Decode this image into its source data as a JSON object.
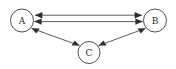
{
  "diagram": {
    "type": "directed-graph",
    "background_color": "#ffffff",
    "node_stroke_color": "#3a3a3a",
    "edge_color": "#4a4a4a",
    "arrow_color": "#2e2e2e",
    "label_color": "#2b2b2b",
    "nodes": [
      {
        "id": "A",
        "label": "A",
        "cx": 22,
        "cy": 20.5,
        "r": 11.5
      },
      {
        "id": "B",
        "label": "B",
        "cx": 155,
        "cy": 20.5,
        "r": 11.5
      },
      {
        "id": "C",
        "label": "C",
        "cx": 89,
        "cy": 52.5,
        "r": 11.0
      }
    ],
    "edges": [
      {
        "id": "ab-upper",
        "from": "A",
        "to": "B",
        "style": "straight",
        "direction": "bidirectional"
      },
      {
        "id": "ab-lower",
        "from": "A",
        "to": "B",
        "style": "straight",
        "direction": "bidirectional"
      },
      {
        "id": "ac",
        "from": "A",
        "to": "C",
        "style": "straight",
        "direction": "bidirectional"
      },
      {
        "id": "bc",
        "from": "B",
        "to": "C",
        "style": "straight",
        "direction": "bidirectional"
      }
    ]
  }
}
